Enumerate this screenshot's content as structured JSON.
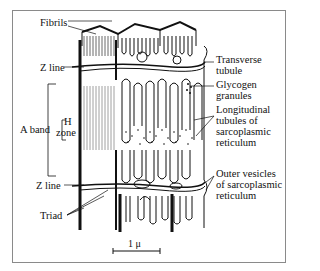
{
  "figure": {
    "labels_left": {
      "fibrils": "Fibrils",
      "z_line_top": "Z line",
      "a_band": "A band",
      "h": "H",
      "zone": "zone",
      "z_line_bottom": "Z line",
      "triad": "Triad"
    },
    "labels_right": {
      "transverse_1": "Transverse",
      "transverse_2": "tubule",
      "glycogen_1": "Glycogen",
      "glycogen_2": "granules",
      "longitudinal_1": "Longitudinal",
      "longitudinal_2": "tubules of",
      "longitudinal_3": "sarcoplasmic",
      "longitudinal_4": "reticulum",
      "outer_1": "Outer vesicles",
      "outer_2": "of sarcoplasmic",
      "outer_3": "reticulum"
    },
    "scale_bar": "1 μ",
    "colors": {
      "ink": "#111111",
      "frame": "#8a8a8a",
      "background": "#ffffff"
    }
  }
}
